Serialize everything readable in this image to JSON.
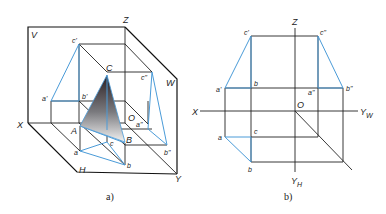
{
  "figure_a": {
    "caption": "a)",
    "planes": {
      "V": "V",
      "W": "W",
      "H": "H"
    },
    "axes": {
      "X": "X",
      "Y": "Y",
      "Z": "Z",
      "O": "O"
    },
    "points_space": {
      "A": "A",
      "B": "B",
      "C": "C"
    },
    "points_v": {
      "a1": "a'",
      "b1": "b'",
      "c1": "c'"
    },
    "points_w": {
      "a2": "a\"",
      "b2": "b\"",
      "c2": "c\""
    },
    "points_h": {
      "a": "a",
      "b": "b",
      "c": "c"
    }
  },
  "figure_b": {
    "caption": "b)",
    "axes": {
      "X": "X",
      "Z": "Z",
      "O": "O",
      "YW": "Y",
      "YW_sub": "W",
      "YH": "Y",
      "YH_sub": "H"
    },
    "points_v": {
      "a1": "a'",
      "b1": "b",
      "c1": "c'"
    },
    "points_w": {
      "a2": "a\"",
      "b2": "b\"",
      "c2": "c\""
    },
    "points_h": {
      "a": "a",
      "b": "b",
      "c": "c"
    }
  },
  "colors": {
    "projection_line": "#4a9bd8",
    "frame": "#222222",
    "triangle_dark": "#2a1e22",
    "triangle_light": "#f2f2f2"
  }
}
